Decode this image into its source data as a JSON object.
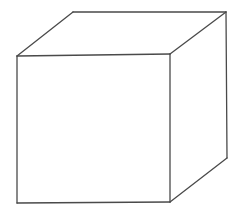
{
  "diagram": {
    "stroke_color": "#4a4a4a",
    "stroke_width": 1.3,
    "background": "#ffffff",
    "vertices": {
      "front_top_left": [
        17,
        56
      ],
      "front_top_right": [
        170,
        54
      ],
      "front_bottom_right": [
        170,
        202
      ],
      "front_bottom_left": [
        17,
        203
      ],
      "back_top_left": [
        73,
        12
      ],
      "back_top_right": [
        226,
        12
      ],
      "back_bottom_right": [
        227,
        158
      ]
    },
    "edges": [
      {
        "name": "front-top-edge",
        "from": "front_top_left",
        "to": "front_top_right"
      },
      {
        "name": "front-right-edge",
        "from": "front_top_right",
        "to": "front_bottom_right"
      },
      {
        "name": "front-bottom-edge",
        "from": "front_bottom_right",
        "to": "front_bottom_left"
      },
      {
        "name": "front-left-edge",
        "from": "front_bottom_left",
        "to": "front_top_left"
      },
      {
        "name": "top-left-depth-edge",
        "from": "front_top_left",
        "to": "back_top_left"
      },
      {
        "name": "back-top-edge",
        "from": "back_top_left",
        "to": "back_top_right"
      },
      {
        "name": "top-right-depth-edge",
        "from": "front_top_right",
        "to": "back_top_right"
      },
      {
        "name": "back-right-edge",
        "from": "back_top_right",
        "to": "back_bottom_right"
      },
      {
        "name": "bottom-right-depth-edge",
        "from": "front_bottom_right",
        "to": "back_bottom_right"
      }
    ]
  }
}
